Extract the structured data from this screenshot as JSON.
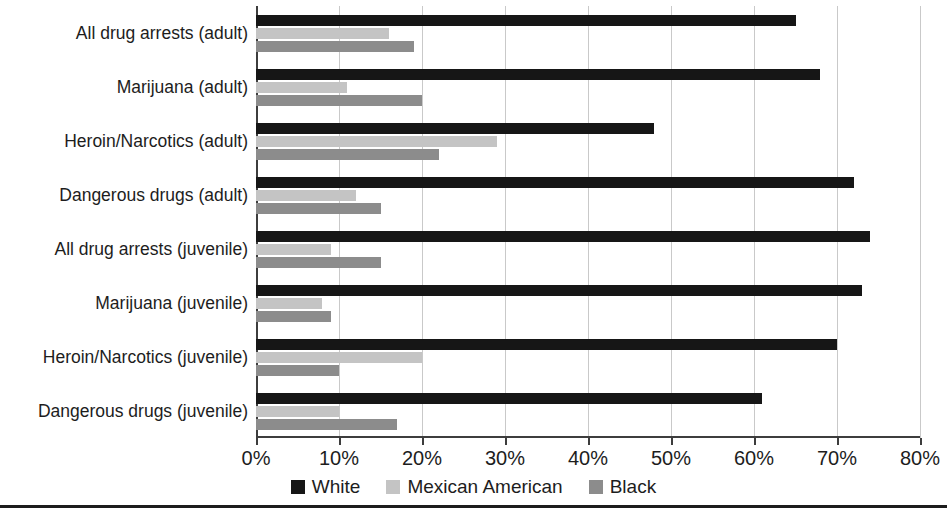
{
  "chart_data": {
    "type": "bar",
    "orientation": "horizontal",
    "title": "",
    "xlabel": "",
    "ylabel": "",
    "xlim": [
      0,
      80
    ],
    "xticks": [
      "0%",
      "10%",
      "20%",
      "30%",
      "40%",
      "50%",
      "60%",
      "70%",
      "80%"
    ],
    "xtick_values": [
      0,
      10,
      20,
      30,
      40,
      50,
      60,
      70,
      80
    ],
    "grid": true,
    "legend_position": "bottom-center",
    "categories": [
      "All drug arrests (adult)",
      "Marijuana (adult)",
      "Heroin/Narcotics (adult)",
      "Dangerous drugs (adult)",
      "All drug arrests (juvenile)",
      "Marijuana (juvenile)",
      "Heroin/Narcotics (juvenile)",
      "Dangerous drugs (juvenile)"
    ],
    "series": [
      {
        "name": "White",
        "color": "#161616",
        "values": [
          65,
          68,
          48,
          72,
          74,
          73,
          70,
          61
        ]
      },
      {
        "name": "Mexican American",
        "color": "#c4c4c4",
        "values": [
          16,
          11,
          29,
          12,
          9,
          8,
          20,
          10
        ]
      },
      {
        "name": "Black",
        "color": "#8c8c8c",
        "values": [
          19,
          20,
          22,
          15,
          15,
          9,
          10,
          17
        ]
      }
    ]
  }
}
